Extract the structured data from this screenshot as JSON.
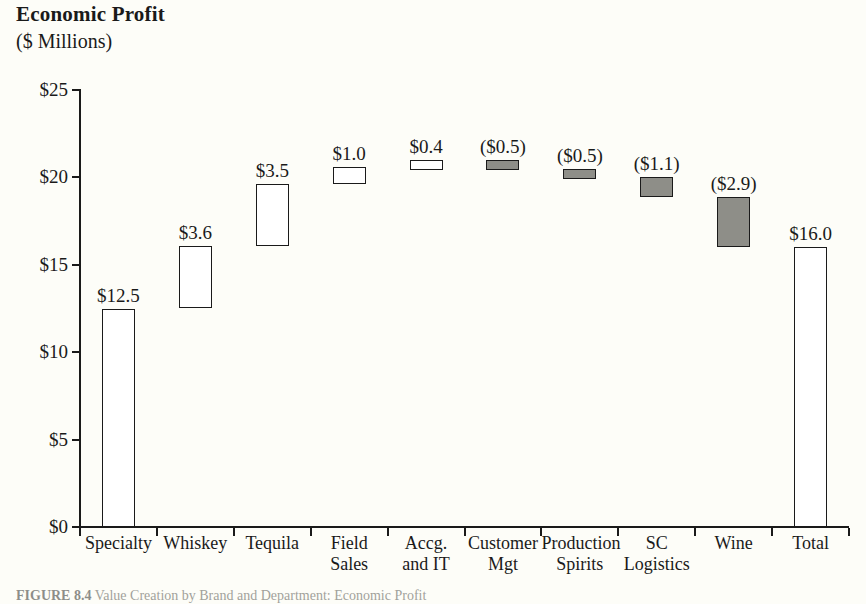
{
  "header": {
    "title": "Economic Profit",
    "subtitle": "($ Millions)"
  },
  "caption": {
    "figure_number": "FIGURE 8.4",
    "text": "Value Creation by Brand and Department: Economic Profit"
  },
  "colors": {
    "positive_fill": "#ffffff",
    "negative_fill": "#8e8e88",
    "outline": "#1a1a1a",
    "background": "#fdfdf8"
  },
  "chart_data": {
    "type": "bar",
    "chart_subtype": "waterfall",
    "title": "Economic Profit",
    "subtitle": "($ Millions)",
    "xlabel": "",
    "ylabel": "($ Millions)",
    "ylim": [
      0,
      25
    ],
    "ytick_values": [
      0,
      5,
      10,
      15,
      20,
      25
    ],
    "ytick_labels": [
      "$0",
      "$5",
      "$10",
      "$15",
      "$20",
      "$25"
    ],
    "grid": false,
    "legend": null,
    "categories": [
      "Specialty",
      "Whiskey",
      "Tequila",
      "Field Sales",
      "Accg. and IT",
      "Customer Mgt",
      "Production Spirits",
      "SC Logistics",
      "Wine",
      "Total"
    ],
    "category_label_lines": [
      [
        "Specialty"
      ],
      [
        "Whiskey"
      ],
      [
        "Tequila"
      ],
      [
        "Field",
        "Sales"
      ],
      [
        "Accg.",
        "and IT"
      ],
      [
        "Customer",
        "Mgt"
      ],
      [
        "Production",
        "Spirits"
      ],
      [
        "SC",
        "Logistics"
      ],
      [
        "Wine"
      ],
      [
        "Total"
      ]
    ],
    "values": [
      12.5,
      3.6,
      3.5,
      1.0,
      0.4,
      -0.5,
      -0.5,
      -1.1,
      -2.9,
      16.0
    ],
    "data_labels": [
      "$12.5",
      "$3.6",
      "$3.5",
      "$1.0",
      "$0.4",
      "($0.5)",
      "($0.5)",
      "($1.1)",
      "($2.9)",
      "$16.0"
    ],
    "bar_kinds": [
      "total",
      "delta",
      "delta",
      "delta",
      "delta",
      "delta",
      "delta",
      "delta",
      "delta",
      "total"
    ],
    "bar_signs": [
      "positive",
      "positive",
      "positive",
      "positive",
      "positive",
      "negative",
      "negative",
      "negative",
      "negative",
      "positive"
    ],
    "segment_bottoms": [
      0.0,
      12.5,
      16.1,
      19.6,
      20.6,
      20.5,
      20.0,
      18.9,
      16.0,
      0.0
    ],
    "segment_tops": [
      12.5,
      16.1,
      19.6,
      20.6,
      21.0,
      21.0,
      20.5,
      20.0,
      18.9,
      16.0
    ]
  }
}
